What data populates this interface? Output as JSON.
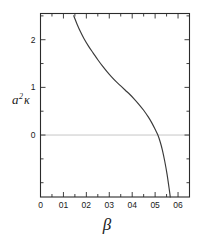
{
  "chart_data": {
    "type": "line",
    "title": "",
    "xlabel": "β",
    "ylabel": "a²κ",
    "xlim": [
      0,
      0.65
    ],
    "ylim": [
      -1.3,
      2.55
    ],
    "grid": false,
    "legend": null,
    "zero_reference_line": 0,
    "x_tick_labels": [
      "0",
      "01",
      "02",
      "03",
      "04",
      "05",
      "06"
    ],
    "x_tick_values": [
      0,
      0.1,
      0.2,
      0.3,
      0.4,
      0.5,
      0.6
    ],
    "x_minor_tick_values": [
      0.05,
      0.15,
      0.25,
      0.35,
      0.45,
      0.55
    ],
    "y_tick_labels": [
      "2",
      "1",
      "0"
    ],
    "y_tick_values": [
      2,
      1,
      0
    ],
    "y_minor_tick_values": [
      2.5,
      1.5,
      0.5,
      -0.5,
      -1.0
    ],
    "series": [
      {
        "name": "a²κ vs β",
        "x": [
          0.145,
          0.16,
          0.175,
          0.19,
          0.21,
          0.23,
          0.25,
          0.27,
          0.29,
          0.31,
          0.33,
          0.35,
          0.37,
          0.39,
          0.41,
          0.43,
          0.45,
          0.47,
          0.485,
          0.5,
          0.512,
          0.522,
          0.532,
          0.542,
          0.552,
          0.562,
          0.566
        ],
        "y": [
          2.5,
          2.32,
          2.16,
          2.02,
          1.86,
          1.72,
          1.58,
          1.45,
          1.33,
          1.22,
          1.12,
          1.03,
          0.94,
          0.85,
          0.75,
          0.64,
          0.52,
          0.38,
          0.26,
          0.12,
          0.0,
          -0.14,
          -0.32,
          -0.55,
          -0.82,
          -1.15,
          -1.3
        ]
      }
    ]
  },
  "axis_labels": {
    "x_title": "β",
    "y_title_base": "a",
    "y_title_sup": "2",
    "y_title_kappa": "κ"
  }
}
